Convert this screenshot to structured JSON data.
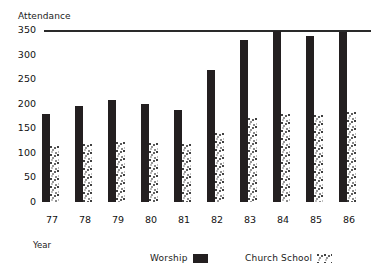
{
  "chart_data": {
    "type": "bar",
    "title": "",
    "ylabel": "Attendance",
    "xlabel": "Year",
    "categories": [
      "77",
      "78",
      "79",
      "80",
      "81",
      "82",
      "83",
      "84",
      "85",
      "86"
    ],
    "series": [
      {
        "name": "Worship",
        "values": [
          180,
          195,
          207,
          200,
          188,
          268,
          330,
          347,
          338,
          345
        ]
      },
      {
        "name": "Church School",
        "values": [
          115,
          118,
          122,
          120,
          118,
          140,
          170,
          180,
          178,
          183
        ]
      }
    ],
    "ylim": [
      0,
      350
    ],
    "yticks": [
      0,
      50,
      100,
      150,
      200,
      250,
      300,
      350
    ],
    "grid": false,
    "reference_line": 350,
    "legend_position": "bottom",
    "legend": [
      {
        "label": "Worship",
        "swatch": "solid-black"
      },
      {
        "label": "Church School",
        "swatch": "stippled"
      }
    ],
    "colors": {
      "worship": "#231f20",
      "church_school": "#3a3a3a",
      "axis": "#1a1a1a"
    }
  }
}
